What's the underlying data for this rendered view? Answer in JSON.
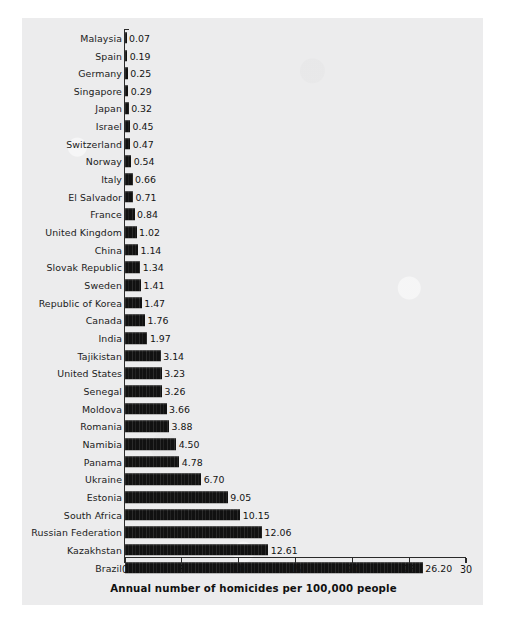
{
  "chart_data": {
    "type": "bar",
    "orientation": "horizontal",
    "title": "",
    "xlabel": "Annual number of homicides per 100,000 people",
    "ylabel": "",
    "xlim": [
      0,
      30
    ],
    "xticks": [
      0,
      5,
      10,
      15,
      20,
      25,
      30
    ],
    "xticklabels": [
      "0",
      "5",
      "10",
      "15",
      "20",
      "25",
      "30"
    ],
    "grid": false,
    "legend": false,
    "bar_color": "#111111",
    "panel_color": "#ececed",
    "value_label_format": "2 decimal places",
    "categories": [
      "Malaysia",
      "Spain",
      "Germany",
      "Singapore",
      "Japan",
      "Israel",
      "Switzerland",
      "Norway",
      "Italy",
      "El Salvador",
      "France",
      "United Kingdom",
      "China",
      "Slovak Republic",
      "Sweden",
      "Republic of Korea",
      "Canada",
      "India",
      "Tajikistan",
      "United States",
      "Senegal",
      "Moldova",
      "Romania",
      "Namibia",
      "Panama",
      "Ukraine",
      "Estonia",
      "South Africa",
      "Russian Federation",
      "Kazakhstan",
      "Brazil"
    ],
    "values": [
      0.07,
      0.19,
      0.25,
      0.29,
      0.32,
      0.45,
      0.47,
      0.54,
      0.66,
      0.71,
      0.84,
      1.02,
      1.14,
      1.34,
      1.41,
      1.47,
      1.76,
      1.97,
      3.14,
      3.23,
      3.26,
      3.66,
      3.88,
      4.5,
      4.78,
      6.7,
      9.05,
      10.15,
      12.06,
      12.61,
      26.2
    ],
    "value_labels": [
      "0.07",
      "0.19",
      "0.25",
      "0.29",
      "0.32",
      "0.45",
      "0.47",
      "0.54",
      "0.66",
      "0.71",
      "0.84",
      "1.02",
      "1.14",
      "1.34",
      "1.41",
      "1.47",
      "1.76",
      "1.97",
      "3.14",
      "3.23",
      "3.26",
      "3.66",
      "3.88",
      "4.50",
      "4.78",
      "6.70",
      "9.05",
      "10.15",
      "12.06",
      "12.61",
      "26.20"
    ]
  }
}
